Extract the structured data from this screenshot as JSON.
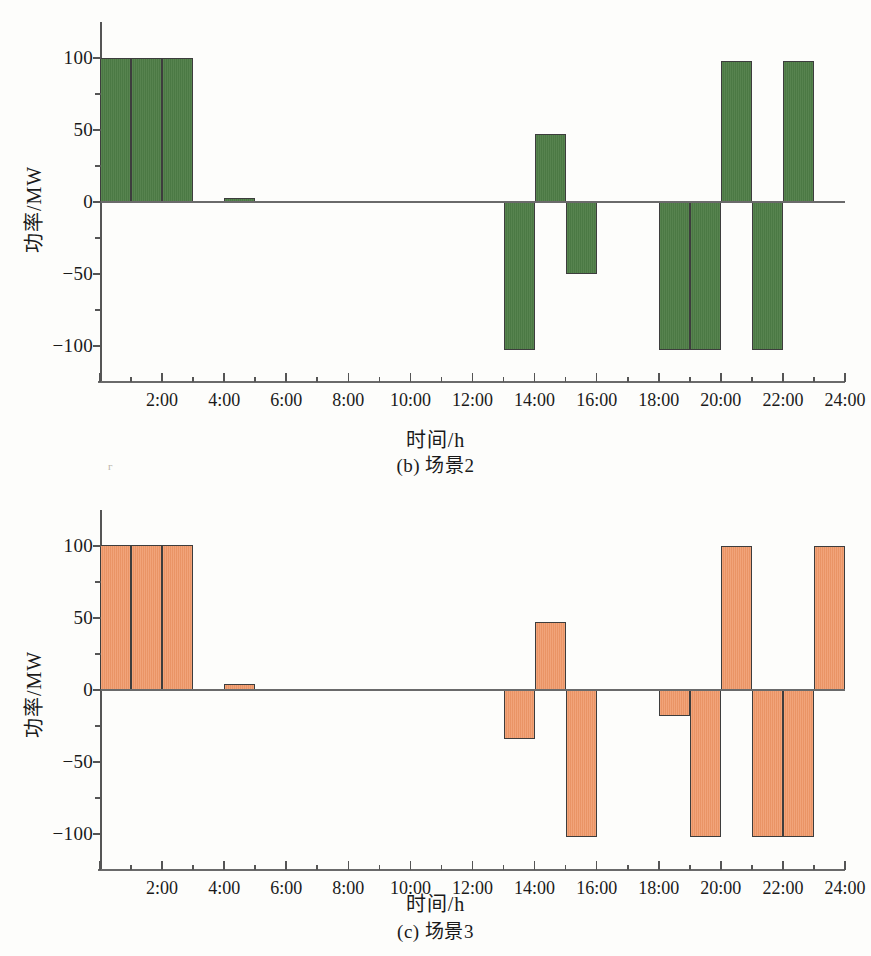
{
  "figure_b": {
    "caption": "(b) 场景2",
    "color": "#4e7d46",
    "axis": {
      "y_title": "功率/MW",
      "x_title": "时间/h",
      "y_ticks": [
        "100",
        "50",
        "0",
        "-50",
        "-100"
      ],
      "x_ticks": [
        "2:00",
        "4:00",
        "6:00",
        "8:00",
        "10:00",
        "12:00",
        "14:00",
        "16:00",
        "18:00",
        "20:00",
        "22:00",
        "24:00"
      ]
    }
  },
  "figure_c": {
    "caption": "(c) 场景3",
    "color": "#f09a6b",
    "axis": {
      "y_title": "功率/MW",
      "x_title": "时间/h",
      "y_ticks": [
        "100",
        "50",
        "0",
        "-50",
        "-100"
      ],
      "x_ticks": [
        "2:00",
        "4:00",
        "6:00",
        "8:00",
        "10:00",
        "12:00",
        "14:00",
        "16:00",
        "18:00",
        "20:00",
        "22:00",
        "24:00"
      ]
    }
  },
  "chart_data": [
    {
      "type": "bar",
      "id": "scenario-2",
      "title": "(b) 场景2",
      "xlabel": "时间/h",
      "ylabel": "功率/MW",
      "series_color": "#4e7d46",
      "ylim": [
        -125,
        125
      ],
      "yticks": [
        -100,
        -50,
        0,
        50,
        100
      ],
      "xlim": [
        0,
        24
      ],
      "xticks": [
        2,
        4,
        6,
        8,
        10,
        12,
        14,
        16,
        18,
        20,
        22,
        24
      ],
      "xticklabels": [
        "2:00",
        "4:00",
        "6:00",
        "8:00",
        "10:00",
        "12:00",
        "14:00",
        "16:00",
        "18:00",
        "20:00",
        "22:00",
        "24:00"
      ],
      "grid": false,
      "legend": null,
      "x": [
        1,
        2,
        3,
        4,
        5,
        6,
        7,
        8,
        9,
        10,
        11,
        12,
        13,
        14,
        15,
        16,
        17,
        18,
        19,
        20,
        21,
        22,
        23,
        24
      ],
      "values": [
        100,
        100,
        100,
        0,
        3,
        0,
        0,
        0,
        0,
        0,
        0,
        0,
        0,
        -103,
        47,
        -50,
        0,
        0,
        -103,
        -103,
        98,
        -103,
        98,
        0
      ]
    },
    {
      "type": "bar",
      "id": "scenario-3",
      "title": "(c) 场景3",
      "xlabel": "时间/h",
      "ylabel": "功率/MW",
      "series_color": "#f09a6b",
      "ylim": [
        -125,
        125
      ],
      "yticks": [
        -100,
        -50,
        0,
        50,
        100
      ],
      "xlim": [
        0,
        24
      ],
      "xticks": [
        2,
        4,
        6,
        8,
        10,
        12,
        14,
        16,
        18,
        20,
        22,
        24
      ],
      "xticklabels": [
        "2:00",
        "4:00",
        "6:00",
        "8:00",
        "10:00",
        "12:00",
        "14:00",
        "16:00",
        "18:00",
        "20:00",
        "22:00",
        "24:00"
      ],
      "grid": false,
      "legend": null,
      "x": [
        1,
        2,
        3,
        4,
        5,
        6,
        7,
        8,
        9,
        10,
        11,
        12,
        13,
        14,
        15,
        16,
        17,
        18,
        19,
        20,
        21,
        22,
        23,
        24
      ],
      "values": [
        101,
        101,
        101,
        0,
        4,
        1,
        0,
        0,
        0,
        0,
        0,
        0,
        0,
        -34,
        47,
        -102,
        0,
        0,
        -18,
        -102,
        100,
        -102,
        -102,
        100
      ]
    }
  ]
}
